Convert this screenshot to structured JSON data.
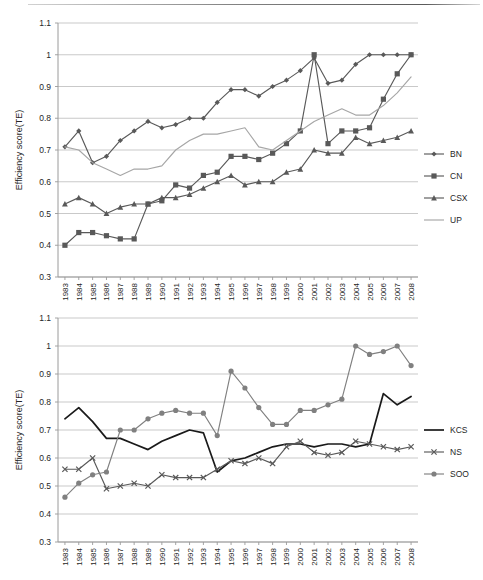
{
  "figure": {
    "y_axis_label": "Efficiency score(TE)",
    "y_ticks": [
      "0.3",
      "0.4",
      "0.5",
      "0.6",
      "0.7",
      "0.8",
      "0.9",
      "1",
      "1.1"
    ],
    "x_ticks": [
      "1983",
      "1984",
      "1985",
      "1986",
      "1987",
      "1988",
      "1989",
      "1990",
      "1991",
      "1992",
      "1993",
      "1994",
      "1995",
      "1996",
      "1997",
      "1998",
      "1999",
      "2000",
      "2001",
      "2002",
      "2003",
      "2004",
      "2005",
      "2006",
      "2007",
      "2008"
    ],
    "colors": {
      "dark_series": "#595959",
      "light_series": "#a6a6a6",
      "black_series": "#1a1a1a",
      "gridline": "#c3c3c3",
      "axis": "#9a9a9a",
      "text": "#262626"
    },
    "caption_partial": ""
  },
  "chart_data": [
    {
      "type": "line",
      "id": "chart-top",
      "title": "",
      "xlabel": "",
      "ylabel": "Efficiency score(TE)",
      "ylim": [
        0.3,
        1.1
      ],
      "ytick_step": 0.1,
      "grid": true,
      "legend_position": "right",
      "categories": [
        "1983",
        "1984",
        "1985",
        "1986",
        "1987",
        "1988",
        "1989",
        "1990",
        "1991",
        "1992",
        "1993",
        "1994",
        "1995",
        "1996",
        "1997",
        "1998",
        "1999",
        "2000",
        "2001",
        "2002",
        "2003",
        "2004",
        "2005",
        "2006",
        "2007",
        "2008"
      ],
      "series": [
        {
          "name": "BN",
          "marker": "diamond",
          "color": "#595959",
          "values": [
            0.71,
            0.76,
            0.66,
            0.68,
            0.73,
            0.76,
            0.79,
            0.77,
            0.78,
            0.8,
            0.8,
            0.85,
            0.89,
            0.89,
            0.87,
            0.9,
            0.92,
            0.95,
            0.99,
            0.91,
            0.92,
            0.97,
            1.0,
            1.0,
            1.0,
            1.0
          ]
        },
        {
          "name": "CN",
          "marker": "square",
          "color": "#595959",
          "values": [
            0.4,
            0.44,
            0.44,
            0.43,
            0.42,
            0.42,
            0.53,
            0.54,
            0.59,
            0.58,
            0.62,
            0.63,
            0.68,
            0.68,
            0.67,
            0.69,
            0.72,
            0.76,
            1.0,
            0.72,
            0.76,
            0.76,
            0.77,
            0.86,
            0.94,
            1.0
          ]
        },
        {
          "name": "CSX",
          "marker": "triangle",
          "color": "#595959",
          "values": [
            0.53,
            0.55,
            0.53,
            0.5,
            0.52,
            0.53,
            0.53,
            0.55,
            0.55,
            0.56,
            0.58,
            0.6,
            0.62,
            0.59,
            0.6,
            0.6,
            0.63,
            0.64,
            0.7,
            0.69,
            0.69,
            0.74,
            0.72,
            0.73,
            0.74,
            0.76
          ]
        },
        {
          "name": "UP",
          "marker": "none",
          "color": "#a6a6a6",
          "values": [
            0.71,
            0.7,
            0.66,
            0.64,
            0.62,
            0.64,
            0.64,
            0.65,
            0.7,
            0.73,
            0.75,
            0.75,
            0.76,
            0.77,
            0.71,
            0.7,
            0.73,
            0.76,
            0.79,
            0.81,
            0.83,
            0.81,
            0.81,
            0.84,
            0.88,
            0.93
          ]
        }
      ]
    },
    {
      "type": "line",
      "id": "chart-bottom",
      "title": "",
      "xlabel": "",
      "ylabel": "Efficiency score(TE)",
      "ylim": [
        0.3,
        1.1
      ],
      "ytick_step": 0.1,
      "grid": true,
      "legend_position": "right",
      "categories": [
        "1983",
        "1984",
        "1985",
        "1986",
        "1987",
        "1988",
        "1989",
        "1990",
        "1991",
        "1992",
        "1993",
        "1994",
        "1995",
        "1996",
        "1997",
        "1998",
        "1999",
        "2000",
        "2001",
        "2002",
        "2003",
        "2004",
        "2005",
        "2006",
        "2007",
        "2008"
      ],
      "series": [
        {
          "name": "KCS",
          "marker": "none",
          "color": "#1a1a1a",
          "values": [
            0.74,
            0.78,
            0.73,
            0.67,
            0.67,
            0.65,
            0.63,
            0.66,
            0.68,
            0.7,
            0.69,
            0.55,
            0.59,
            0.6,
            0.62,
            0.64,
            0.65,
            0.65,
            0.64,
            0.65,
            0.65,
            0.64,
            0.65,
            0.83,
            0.79,
            0.82
          ]
        },
        {
          "name": "NS",
          "marker": "cross",
          "color": "#595959",
          "values": [
            0.56,
            0.56,
            0.6,
            0.49,
            0.5,
            0.51,
            0.5,
            0.54,
            0.53,
            0.53,
            0.53,
            0.56,
            0.59,
            0.58,
            0.6,
            0.58,
            0.64,
            0.66,
            0.62,
            0.61,
            0.62,
            0.66,
            0.65,
            0.64,
            0.63,
            0.64
          ]
        },
        {
          "name": "SOO",
          "marker": "circle",
          "color": "#808080",
          "values": [
            0.46,
            0.51,
            0.54,
            0.55,
            0.7,
            0.7,
            0.74,
            0.76,
            0.77,
            0.76,
            0.76,
            0.68,
            0.91,
            0.85,
            0.78,
            0.72,
            0.72,
            0.77,
            0.77,
            0.79,
            0.81,
            1.0,
            0.97,
            0.98,
            1.0,
            0.93
          ]
        }
      ]
    }
  ]
}
